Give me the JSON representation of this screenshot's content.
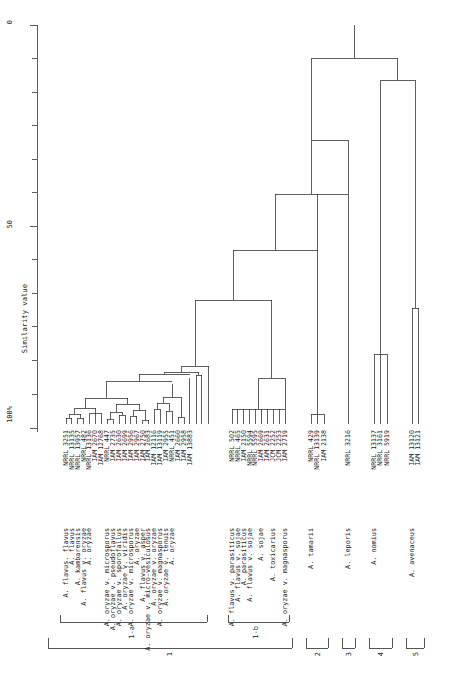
{
  "figure": {
    "type": "dendrogram",
    "axis": {
      "title": "Similarity value",
      "ticks": [
        "0",
        "50",
        "100%"
      ],
      "tick_values": [
        0,
        50,
        100
      ],
      "minor_ticks": 11
    }
  },
  "chart_data": {
    "type": "dendrogram",
    "title": "",
    "xlabel": "",
    "ylabel": "Similarity value",
    "ylim": [
      0,
      100
    ],
    "orientation": "vertical",
    "leaves": [
      {
        "i": 0,
        "collection": "NRRL",
        "number": "3251",
        "species": "A. flavus. flavus",
        "group": "1-a",
        "major": "1"
      },
      {
        "i": 1,
        "collection": "NRRL",
        "number": "13135",
        "species": "A. flavus",
        "group": "1-a",
        "major": "1"
      },
      {
        "i": 2,
        "collection": "NRRL",
        "number": "13957",
        "species": "A. kambarensis",
        "group": "1-a",
        "major": "1"
      },
      {
        "i": 3,
        "collection": "NRRL",
        "number": "482",
        "species": "A. flavus v. oryzae",
        "group": "1-a",
        "major": "1"
      },
      {
        "i": 4,
        "collection": "NRRL",
        "number": "13136",
        "species": "A. oryzae",
        "group": "1-a",
        "major": "1"
      },
      {
        "i": 5,
        "collection": "IAM",
        "number": "2670",
        "species": "",
        "group": "1-a",
        "major": "1"
      },
      {
        "i": 6,
        "collection": "IAM",
        "number": "12768",
        "species": "",
        "group": "1-a",
        "major": "1"
      },
      {
        "i": 7,
        "collection": "NRRL",
        "number": "447",
        "species": "A. oryzae v. microsporus",
        "group": "1-a",
        "major": "1"
      },
      {
        "i": 8,
        "collection": "IAM",
        "number": "2735",
        "species": "A. oryzae v. pseudoflavus",
        "group": "1-a",
        "major": "1"
      },
      {
        "i": 9,
        "collection": "IAM",
        "number": "2630",
        "species": "A. oryzae v. sporofallus",
        "group": "1-a",
        "major": "1"
      },
      {
        "i": 10,
        "collection": "IAM",
        "number": "2699",
        "species": "A. oryzae v. viridis",
        "group": "1-a",
        "major": "1"
      },
      {
        "i": 11,
        "collection": "IAM",
        "number": "2956",
        "species": "A. oryzae v. microsporus",
        "group": "1-a",
        "major": "1"
      },
      {
        "i": 12,
        "collection": "IAM",
        "number": "2967",
        "species": "A. oryzae",
        "group": "1-a",
        "major": "1"
      },
      {
        "i": 13,
        "collection": "IAM",
        "number": "2750",
        "species": "A. flavus v. asper",
        "group": "1-a",
        "major": "1"
      },
      {
        "i": 14,
        "collection": "IAM",
        "number": "2683",
        "species": "A. oryzae v. micro-vesiculosus",
        "group": "1-a",
        "major": "1"
      },
      {
        "i": 15,
        "collection": "IAM",
        "number": "12116",
        "species": "A. oryzae v. oryzae",
        "group": "1-a",
        "major": "1"
      },
      {
        "i": 16,
        "collection": "IAM",
        "number": "13119",
        "species": "A. oryzae v. magnasporus",
        "group": "1-a",
        "major": "1"
      },
      {
        "i": 17,
        "collection": "IAM",
        "number": "2955",
        "species": "A. oryzae v. tenuis",
        "group": "1-a",
        "major": "1"
      },
      {
        "i": 18,
        "collection": "NRRL",
        "number": "451",
        "species": "A. oryzae",
        "group": "1-a",
        "major": "1"
      },
      {
        "i": 19,
        "collection": "IAM",
        "number": "2660",
        "species": "",
        "group": "1-a",
        "major": "1"
      },
      {
        "i": 20,
        "collection": "IAM",
        "number": "2958",
        "species": "",
        "group": "1-a",
        "major": "1"
      },
      {
        "i": 21,
        "collection": "IAM",
        "number": "13883",
        "species": "",
        "group": "1-a",
        "major": "1"
      },
      {
        "i": 22,
        "collection": "NRRL",
        "number": "502",
        "species": "A. flavus v. parasiticus",
        "group": "1-b",
        "major": "1"
      },
      {
        "i": 23,
        "collection": "NRRL",
        "number": "465",
        "species": "A. flavus v. sojae",
        "group": "1-b",
        "major": "1"
      },
      {
        "i": 24,
        "collection": "IAM",
        "number": "2150",
        "species": "A. parasiticus",
        "group": "1-b",
        "major": "1"
      },
      {
        "i": 25,
        "collection": "NRRL",
        "number": "5594",
        "species": "A. flavus v. sojae",
        "group": "1-b",
        "major": "1"
      },
      {
        "i": 26,
        "collection": "NRRL",
        "number": "5595",
        "species": "",
        "group": "1-b",
        "major": "1"
      },
      {
        "i": 27,
        "collection": "IAM",
        "number": "2669",
        "species": "A. sojae",
        "group": "1-b",
        "major": "1"
      },
      {
        "i": 28,
        "collection": "IAM",
        "number": "2631",
        "species": "",
        "group": "1-b",
        "major": "1"
      },
      {
        "i": 29,
        "collection": "JCM",
        "number": "2252",
        "species": "A. toxicarius",
        "group": "1-b",
        "major": "1"
      },
      {
        "i": 30,
        "collection": "JCM",
        "number": "2253",
        "species": "",
        "group": "1-b",
        "major": "1"
      },
      {
        "i": 31,
        "collection": "IAM",
        "number": "2719",
        "species": "A. oryzae v. magnasporus",
        "group": "1-b",
        "major": "1"
      },
      {
        "i": 32,
        "collection": "NRRL",
        "number": "429",
        "species": "A. tamarii",
        "group": "2",
        "major": "2"
      },
      {
        "i": 33,
        "collection": "NRRL",
        "number": "13139",
        "species": "",
        "group": "2",
        "major": "2"
      },
      {
        "i": 34,
        "collection": "IAM",
        "number": "2138",
        "species": "",
        "group": "2",
        "major": "2"
      },
      {
        "i": 35,
        "collection": "NRRL",
        "number": "3216",
        "species": "A. leporis",
        "group": "3",
        "major": "3"
      },
      {
        "i": 36,
        "collection": "NRRL",
        "number": "13137",
        "species": "A. nomius",
        "group": "4",
        "major": "4"
      },
      {
        "i": 37,
        "collection": "NRRL",
        "number": "3161",
        "species": "",
        "group": "4",
        "major": "4"
      },
      {
        "i": 38,
        "collection": "NRRL",
        "number": "5919",
        "species": "",
        "group": "4",
        "major": "4"
      },
      {
        "i": 39,
        "collection": "IAM",
        "number": "13120",
        "species": "A. avenaceus",
        "group": "5",
        "major": "5"
      },
      {
        "i": 40,
        "collection": "IAM",
        "number": "13121",
        "species": "",
        "group": "5",
        "major": "5"
      }
    ],
    "groups": [
      {
        "label": "1-a",
        "from": 0,
        "to": 21
      },
      {
        "label": "1-b",
        "from": 22,
        "to": 31
      },
      {
        "label": "1",
        "from": 0,
        "to": 31
      },
      {
        "label": "2",
        "from": 32,
        "to": 34
      },
      {
        "label": "3",
        "from": 35,
        "to": 35
      },
      {
        "label": "4",
        "from": 36,
        "to": 38
      },
      {
        "label": "5",
        "from": 39,
        "to": 40
      }
    ]
  }
}
